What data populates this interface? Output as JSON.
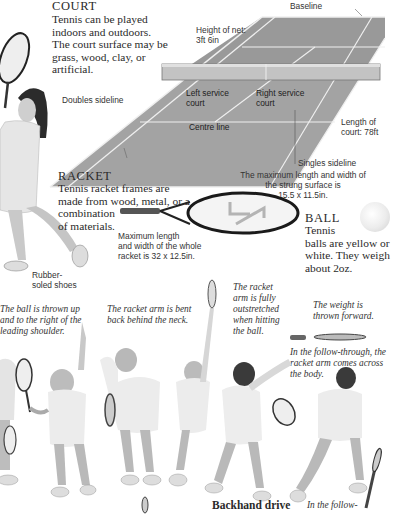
{
  "court": {
    "heading": "COURT",
    "body_lines": [
      "Tennis can be played",
      "indoors and outdoors.",
      "The court surface may be",
      "grass, wood, clay, or",
      "artificial."
    ],
    "labels": {
      "baseline": "Baseline",
      "net_height_1": "Height of net:",
      "net_height_2": "3ft 6in",
      "doubles_sideline": "Doubles sideline",
      "left_service_1": "Left service",
      "left_service_2": "court",
      "right_service_1": "Right service",
      "right_service_2": "court",
      "centre_line": "Centre line",
      "length_1": "Length of",
      "length_2": "court: 78ft",
      "singles_sideline": "Singles sideline"
    }
  },
  "racket": {
    "heading": "RACKET",
    "body_lines": [
      "Tennis racket frames are",
      "made from wood, metal, or a",
      "combination",
      "of materials."
    ],
    "strung_surface_lines": [
      "The maximum length and width of",
      "the strung surface is",
      "15.5 x 11.5in."
    ],
    "whole_racket_lines": [
      "Maximum length",
      "and width of the whole",
      "racket is 32 x 12.5in."
    ]
  },
  "ball": {
    "heading": "BALL",
    "body_lines": [
      "Tennis",
      "balls are yellow or",
      "white. They weigh",
      "about 2oz."
    ]
  },
  "player": {
    "shoes_label_1": "Rubber-",
    "shoes_label_2": "soled shoes"
  },
  "serve_sequence": {
    "captions": [
      [
        "The ball is thrown up",
        "and to the right of the",
        "leading shoulder."
      ],
      [
        "The racket arm is bent",
        "back behind the neck."
      ],
      [
        "The racket",
        "arm is fully",
        "outstretched",
        "when hitting",
        "the ball."
      ],
      [
        "The weight is",
        "thrown forward."
      ],
      [
        "In the follow-through, the",
        "racket arm comes across",
        "the body."
      ]
    ]
  },
  "backhand": {
    "title": "Backhand drive",
    "caption_start": "In the follow-"
  },
  "colors": {
    "court_fill": "#9a9a9a",
    "court_lines": "#e8e8e8",
    "net": "#b8b8b8",
    "text": "#2a2a2a"
  }
}
